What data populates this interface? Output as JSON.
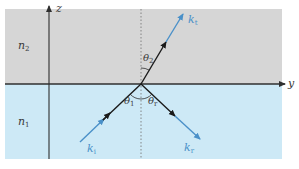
{
  "diagram": {
    "colors": {
      "upper_medium": "#d6d6d6",
      "lower_medium": "#cde9f6",
      "axis": "#2f2f2f",
      "ray_black": "#1a1a1a",
      "ray_blue": "#4a90c8",
      "normal": "#7a7a7a"
    },
    "axes": {
      "vertical": {
        "label": "z"
      },
      "horizontal": {
        "label": "y"
      }
    },
    "media": {
      "upper": {
        "label": "n",
        "subscript": "2"
      },
      "lower": {
        "label": "n",
        "subscript": "1"
      }
    },
    "rays": {
      "incident": {
        "label": "k",
        "subscript": "i"
      },
      "reflected": {
        "label": "k",
        "subscript": "r"
      },
      "transmitted": {
        "label": "k",
        "subscript": "t"
      }
    },
    "angles": {
      "incident": {
        "label": "θ",
        "subscript": "1"
      },
      "reflected": {
        "label": "θ",
        "subscript": "r"
      },
      "transmitted": {
        "label": "θ",
        "subscript": "2"
      }
    }
  }
}
